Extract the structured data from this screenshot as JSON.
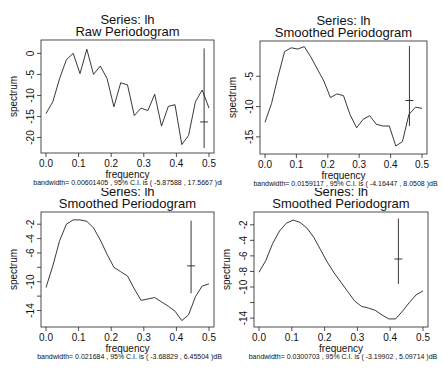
{
  "chart_data": [
    {
      "type": "line",
      "title": "Series:  lh",
      "subtitle": "Raw Periodogram",
      "xlabel": "frequency",
      "ylabel": "spectrum",
      "caption": "bandwidth= 0.00601405 , 95% C.I. is ( -5.87588 , 17.5667 )dB",
      "xlim": [
        0,
        0.5
      ],
      "ylim": [
        -22.5,
        2
      ],
      "xticks": [
        0.0,
        0.1,
        0.2,
        0.3,
        0.4,
        0.5
      ],
      "xtick_labels": [
        "0.0",
        "0.1",
        "0.2",
        "0.3",
        "0.4",
        "0.5"
      ],
      "yticks": [
        0,
        -5,
        -10,
        -15,
        -20
      ],
      "ytick_labels": [
        "0",
        "-5",
        "-10",
        "-15",
        "-20"
      ],
      "grid": false,
      "x": [
        0.0,
        0.0208,
        0.0417,
        0.0625,
        0.0833,
        0.1042,
        0.125,
        0.1458,
        0.1667,
        0.1875,
        0.2083,
        0.2292,
        0.25,
        0.2708,
        0.2917,
        0.3125,
        0.3333,
        0.3542,
        0.375,
        0.3958,
        0.4167,
        0.4375,
        0.4583,
        0.4792,
        0.5
      ],
      "values": [
        -14.3,
        -11.5,
        -6.0,
        -1.5,
        0.0,
        -4.8,
        1.0,
        -5.0,
        -3.0,
        -6.0,
        -12.7,
        -7.0,
        -7.5,
        -14.8,
        -13.0,
        -13.6,
        -9.7,
        -17.3,
        -12.6,
        -12.2,
        -21.7,
        -19.5,
        -11.5,
        -8.7,
        -13.0
      ],
      "ci_bar": {
        "x": 0.485,
        "center": -16.3,
        "lower": -22.5,
        "upper": 1.2
      }
    },
    {
      "type": "line",
      "title": "Series:  lh",
      "subtitle": "Smoothed Periodogram",
      "xlabel": "frequency",
      "ylabel": "spectrum",
      "caption": "bandwidth= 0.0159117 , 95% C.I. is ( -4.16447 , 8.0508 )dB",
      "xlim": [
        0,
        0.5
      ],
      "ylim": [
        -17,
        0
      ],
      "xticks": [
        0.0,
        0.1,
        0.2,
        0.3,
        0.4,
        0.5
      ],
      "xtick_labels": [
        "0.0",
        "0.1",
        "0.2",
        "0.3",
        "0.4",
        "0.5"
      ],
      "yticks": [
        -5,
        -10,
        -15
      ],
      "ytick_labels": [
        "-5",
        "-10",
        "-15"
      ],
      "grid": false,
      "x": [
        0.0,
        0.0208,
        0.0417,
        0.0625,
        0.0833,
        0.1042,
        0.125,
        0.1458,
        0.1667,
        0.1875,
        0.2083,
        0.2292,
        0.25,
        0.2708,
        0.2917,
        0.3125,
        0.3333,
        0.3542,
        0.375,
        0.3958,
        0.4167,
        0.4375,
        0.4583,
        0.4792,
        0.5
      ],
      "values": [
        -12.6,
        -9.5,
        -5.0,
        -0.9,
        -0.3,
        -0.5,
        -0.1,
        -1.8,
        -3.8,
        -5.8,
        -8.5,
        -7.9,
        -8.2,
        -11.3,
        -13.5,
        -12.1,
        -11.5,
        -12.9,
        -13.2,
        -13.2,
        -16.5,
        -15.8,
        -11.3,
        -10.1,
        -10.3
      ],
      "ci_bar": {
        "x": 0.46,
        "center": -9.0,
        "lower": -13.2,
        "upper": 0.0
      }
    },
    {
      "type": "line",
      "title": "Series:  lh",
      "subtitle": "Smoothed Periodogram",
      "xlabel": "frequency",
      "ylabel": "spectrum",
      "caption": "bandwidth= 0.021684 , 95% C.I. is ( -3.68829 , 6.45504 )dB",
      "xlim": [
        0,
        0.5
      ],
      "ylim": [
        -15.6,
        -1.0
      ],
      "xticks": [
        0.0,
        0.1,
        0.2,
        0.3,
        0.4,
        0.5
      ],
      "xtick_labels": [
        "0.0",
        "0.1",
        "0.2",
        "0.3",
        "0.4",
        "0.5"
      ],
      "yticks": [
        -2,
        -4,
        -6,
        -8,
        -10,
        -12,
        -14
      ],
      "ytick_labels": [
        "-2",
        "-4",
        "-6",
        "",
        "-10",
        "",
        "-14"
      ],
      "grid": false,
      "x": [
        0.0,
        0.0208,
        0.0417,
        0.0625,
        0.0833,
        0.1042,
        0.125,
        0.1458,
        0.1667,
        0.1875,
        0.2083,
        0.2292,
        0.25,
        0.2708,
        0.2917,
        0.3125,
        0.3333,
        0.3542,
        0.375,
        0.3958,
        0.4167,
        0.4375,
        0.4583,
        0.4792,
        0.5
      ],
      "values": [
        -10.8,
        -7.8,
        -4.3,
        -2.0,
        -1.4,
        -1.4,
        -1.6,
        -2.5,
        -4.2,
        -6.2,
        -8.0,
        -8.6,
        -9.2,
        -11.0,
        -12.6,
        -12.4,
        -12.2,
        -12.8,
        -13.4,
        -14.1,
        -15.4,
        -14.6,
        -12.1,
        -10.6,
        -10.3
      ],
      "ci_bar": {
        "x": 0.445,
        "center": -7.8,
        "lower": -11.6,
        "upper": -1.5
      }
    },
    {
      "type": "line",
      "title": "Series:  lh",
      "subtitle": "Smoothed Periodogram",
      "xlabel": "frequency",
      "ylabel": "spectrum",
      "caption": "bandwidth= 0.0300703 , 95% C.I. is ( -3.19902 , 5.09714 )dB",
      "xlim": [
        0,
        0.5
      ],
      "ylim": [
        -14.5,
        -1.0
      ],
      "xticks": [
        0.0,
        0.1,
        0.2,
        0.3,
        0.4,
        0.5
      ],
      "xtick_labels": [
        "0.0",
        "0.1",
        "0.2",
        "0.3",
        "0.4",
        "0.5"
      ],
      "yticks": [
        -2,
        -4,
        -6,
        -8,
        -10,
        -12,
        -14
      ],
      "ytick_labels": [
        "-2",
        "-4",
        "-6",
        "-8",
        "-10",
        "",
        "-14"
      ],
      "grid": false,
      "x": [
        0.0,
        0.0208,
        0.0417,
        0.0625,
        0.0833,
        0.1042,
        0.125,
        0.1458,
        0.1667,
        0.1875,
        0.2083,
        0.2292,
        0.25,
        0.2708,
        0.2917,
        0.3125,
        0.3333,
        0.3542,
        0.375,
        0.3958,
        0.4167,
        0.4375,
        0.4583,
        0.4792,
        0.5
      ],
      "values": [
        -8.1,
        -6.6,
        -4.4,
        -2.8,
        -1.8,
        -1.4,
        -1.7,
        -2.4,
        -3.6,
        -5.2,
        -6.8,
        -8.2,
        -9.4,
        -10.6,
        -11.8,
        -12.5,
        -12.7,
        -13.0,
        -13.6,
        -14.1,
        -14.1,
        -13.1,
        -12.0,
        -11.0,
        -10.5
      ],
      "ci_bar": {
        "x": 0.425,
        "center": -6.4,
        "lower": -9.6,
        "upper": -1.2
      }
    }
  ]
}
